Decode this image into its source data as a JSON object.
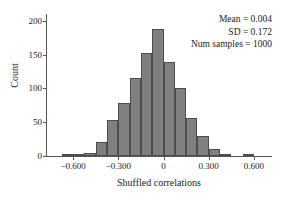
{
  "chart_data": {
    "type": "bar",
    "subtype": "histogram",
    "title": "",
    "xlabel": "Shuffled correlations",
    "ylabel": "Count",
    "xlim": [
      -0.78,
      0.72
    ],
    "ylim": [
      0,
      210
    ],
    "grid": false,
    "legend": null,
    "bin_width": 0.075,
    "bar_color": "#808080",
    "bar_edge_color": "#4d4d4d",
    "axis_color": "#555555",
    "bin_centers": [
      -0.6375,
      -0.5625,
      -0.4875,
      -0.4125,
      -0.3375,
      -0.2625,
      -0.1875,
      -0.1125,
      -0.0375,
      0.0375,
      0.1125,
      0.1875,
      0.2625,
      0.3375,
      0.4125,
      0.4875,
      0.5625
    ],
    "values": [
      2,
      3,
      5,
      21,
      54,
      79,
      116,
      153,
      188,
      139,
      101,
      56,
      29,
      11,
      3,
      0,
      1
    ],
    "xticks": [
      -0.6,
      -0.3,
      0,
      0.3,
      0.6
    ],
    "xtick_labels": [
      "−0.600",
      "−0.300",
      "0",
      "0.300",
      "0.600"
    ],
    "yticks": [
      0,
      50,
      100,
      150,
      200
    ],
    "ytick_labels": [
      "0",
      "50",
      "100",
      "150",
      "200"
    ],
    "annotations": [
      "Mean = 0.004",
      "SD = 0.172",
      "Num samples = 1000"
    ]
  }
}
